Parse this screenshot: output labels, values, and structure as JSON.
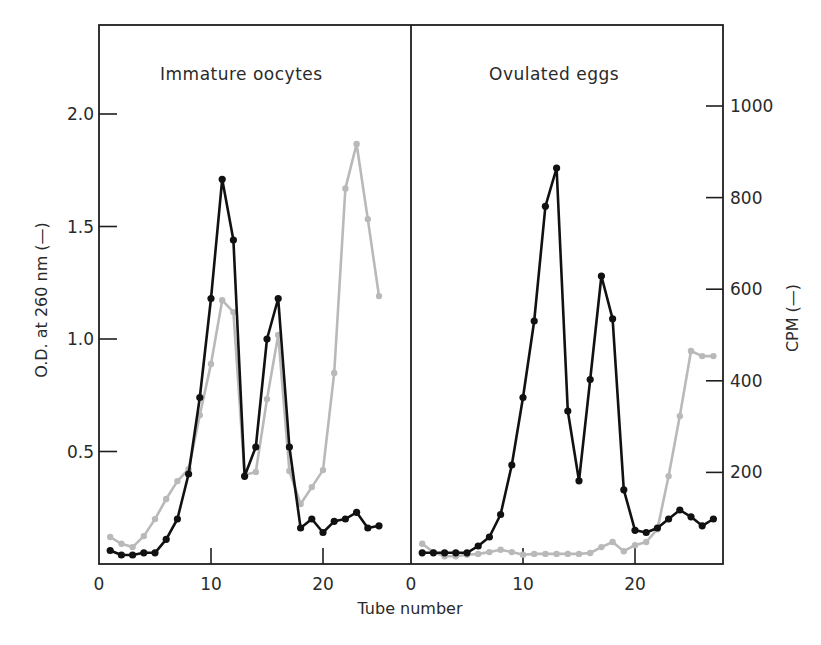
{
  "chart_data": {
    "type": "line",
    "layout": "two side-by-side panels sharing a frame; left y-axis O.D., right y-axis CPM",
    "xlabel": "Tube number",
    "ylabel_left": "O.D. at 260 nm (—)",
    "ylabel_right": "CPM (—)",
    "left_axis": {
      "ticks": [
        0.5,
        1.0,
        1.5,
        2.0
      ],
      "tick_labels": [
        "0.5",
        "1.0",
        "1.5",
        "2.0"
      ],
      "ylim": [
        0,
        2.4
      ]
    },
    "right_axis": {
      "ticks": [
        200,
        400,
        600,
        800,
        1000
      ],
      "tick_labels": [
        "200",
        "400",
        "600",
        "800",
        "1000"
      ],
      "ylim": [
        0,
        1200
      ]
    },
    "x_ticks": [
      0,
      10,
      20
    ],
    "x_tick_labels": [
      "0",
      "10",
      "20"
    ],
    "grid": false,
    "legend": "inline in axis labels: black line = O.D. at 260 nm, gray line = CPM",
    "panels": [
      {
        "title": "Immature oocytes",
        "xlim": [
          0,
          27.8
        ],
        "series": [
          {
            "name": "O.D. at 260 nm",
            "color": "#111111",
            "axis": "left",
            "x": [
              1,
              2,
              3,
              4,
              5,
              6,
              7,
              8,
              9,
              10,
              11,
              12,
              13,
              14,
              15,
              16,
              17,
              18,
              19,
              20,
              21,
              22,
              23,
              24,
              25
            ],
            "values": [
              0.06,
              0.04,
              0.04,
              0.05,
              0.05,
              0.11,
              0.2,
              0.4,
              0.74,
              1.18,
              1.71,
              1.44,
              0.39,
              0.52,
              1.0,
              1.18,
              0.52,
              0.16,
              0.2,
              0.14,
              0.19,
              0.2,
              0.23,
              0.16,
              0.17
            ]
          },
          {
            "name": "CPM",
            "color": "#b9b9b9",
            "axis": "right",
            "x": [
              1,
              2,
              3,
              4,
              5,
              6,
              7,
              8,
              9,
              10,
              11,
              12,
              13,
              14,
              15,
              16,
              17,
              18,
              19,
              20,
              21,
              22,
              23,
              24,
              25
            ],
            "values": [
              59,
              44,
              37,
              61,
              98,
              142,
              181,
              207,
              325,
              437,
              576,
              550,
              194,
              201,
              360,
              500,
              203,
              131,
              168,
              205,
              417,
              820,
              917,
              753,
              585
            ]
          }
        ]
      },
      {
        "title": "Ovulated eggs",
        "xlim": [
          0,
          27.8
        ],
        "series": [
          {
            "name": "O.D. at 260 nm",
            "color": "#111111",
            "axis": "left",
            "x": [
              1,
              2,
              3,
              4,
              5,
              6,
              7,
              8,
              9,
              10,
              11,
              12,
              13,
              14,
              15,
              16,
              17,
              18,
              19,
              20,
              21,
              22,
              23,
              24,
              25,
              26,
              27
            ],
            "values": [
              0.05,
              0.05,
              0.05,
              0.05,
              0.05,
              0.08,
              0.12,
              0.22,
              0.44,
              0.74,
              1.08,
              1.59,
              1.76,
              0.68,
              0.37,
              0.82,
              1.28,
              1.09,
              0.33,
              0.15,
              0.14,
              0.16,
              0.2,
              0.24,
              0.21,
              0.17,
              0.2
            ]
          },
          {
            "name": "CPM",
            "color": "#b9b9b9",
            "axis": "right",
            "x": [
              1,
              2,
              3,
              4,
              5,
              6,
              7,
              8,
              9,
              10,
              11,
              12,
              13,
              14,
              15,
              16,
              17,
              18,
              19,
              20,
              21,
              22,
              23,
              24,
              25,
              26,
              27
            ],
            "values": [
              44,
              26,
              17,
              17,
              20,
              22,
              26,
              31,
              26,
              20,
              22,
              22,
              22,
              22,
              22,
              24,
              37,
              48,
              28,
              41,
              48,
              76,
              192,
              323,
              465,
              454,
              454
            ]
          }
        ]
      }
    ]
  }
}
